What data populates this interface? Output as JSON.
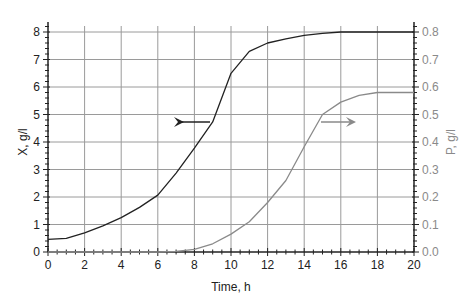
{
  "chart_data": {
    "type": "line",
    "title": "",
    "xlabel": "Time, h",
    "ylabel_left": "X, g/l",
    "ylabel_right": "P, g/l",
    "xlim": [
      0,
      20
    ],
    "ylim_left": [
      0,
      8
    ],
    "ylim_right": [
      0,
      0.8
    ],
    "x_ticks": [
      0,
      2,
      4,
      6,
      8,
      10,
      12,
      14,
      16,
      18,
      20
    ],
    "y_left_ticks": [
      0,
      1,
      2,
      3,
      4,
      5,
      6,
      7,
      8
    ],
    "y_right_ticks": [
      "0.0",
      "0.1",
      "0.2",
      "0.3",
      "0.4",
      "0.5",
      "0.6",
      "0.7",
      "0.8"
    ],
    "grid": true,
    "series": [
      {
        "name": "X",
        "axis": "left",
        "color": "#222222",
        "x": [
          0,
          1,
          2,
          3,
          4,
          5,
          6,
          7,
          8,
          9,
          10,
          11,
          12,
          13,
          14,
          15,
          16,
          17,
          18,
          19,
          20
        ],
        "y": [
          0.46,
          0.5,
          0.7,
          0.95,
          1.25,
          1.62,
          2.07,
          2.87,
          3.78,
          4.73,
          6.5,
          7.3,
          7.6,
          7.75,
          7.88,
          7.95,
          8.0,
          8.0,
          8.0,
          8.0,
          8.0
        ]
      },
      {
        "name": "P",
        "axis": "right",
        "color": "#8a8a8a",
        "x": [
          0,
          1,
          2,
          3,
          4,
          5,
          6,
          7,
          8,
          9,
          10,
          11,
          12,
          13,
          14,
          15,
          16,
          17,
          18,
          19,
          20
        ],
        "y": [
          0,
          0,
          0,
          0,
          0,
          0,
          0,
          0.002,
          0.01,
          0.03,
          0.065,
          0.11,
          0.18,
          0.26,
          0.383,
          0.5,
          0.545,
          0.57,
          0.58,
          0.58,
          0.58
        ]
      }
    ],
    "annotations": [
      {
        "type": "arrow",
        "direction": "left",
        "color": "#222222",
        "at_x": 9,
        "meaning": "X curve uses left axis"
      },
      {
        "type": "arrow",
        "direction": "right",
        "color": "#8a8a8a",
        "at_x": 15,
        "meaning": "P curve uses right axis"
      }
    ]
  }
}
